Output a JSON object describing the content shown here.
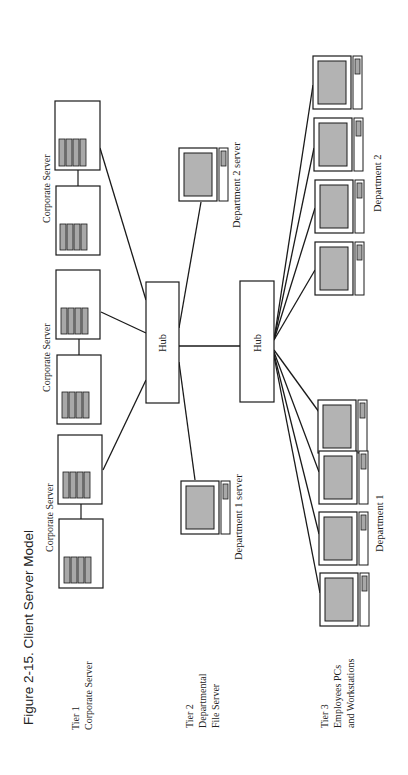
{
  "figure": {
    "title": "Figure 2-15.  Client Server Model",
    "orientation": "rotated 90° counter-clockwise"
  },
  "tiers": [
    {
      "label_line1": "Tier 1",
      "label_line2": "Corporate Server",
      "label_line3": ""
    },
    {
      "label_line1": "Tier 2",
      "label_line2": "Departmental",
      "label_line3": "File Server"
    },
    {
      "label_line1": "Tier 3",
      "label_line2": "Employees PCs",
      "label_line3": "and Workstations"
    }
  ],
  "hubs": [
    {
      "label": "Hub"
    },
    {
      "label": "Hub"
    }
  ],
  "corporate_servers": [
    {
      "label": "Corporate Server"
    },
    {
      "label": "Corporate Server"
    },
    {
      "label": "Corporate Server"
    }
  ],
  "departmental_servers": [
    {
      "label": "Department 2 server"
    },
    {
      "label": "Department 1 server"
    }
  ],
  "departments": [
    {
      "label": "Department 2",
      "pc_count": 4
    },
    {
      "label": "Department 1",
      "pc_count": 4
    }
  ],
  "colors": {
    "line": "#1a1a1a",
    "screen_fill": "#b3b3b3",
    "drive_fill": "#a8a8a8",
    "background": "#ffffff"
  }
}
